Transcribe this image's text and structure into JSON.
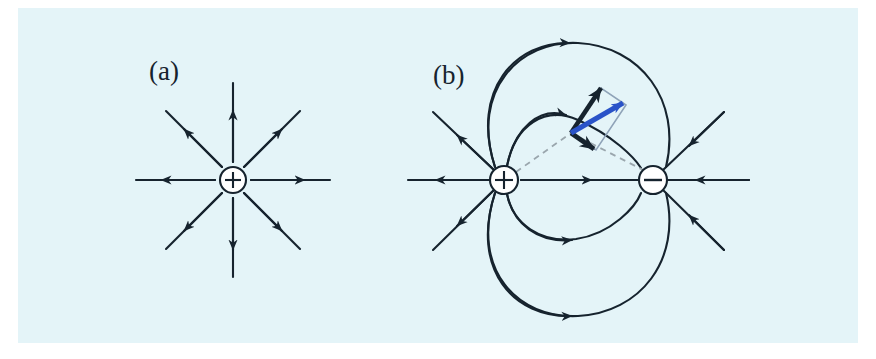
{
  "figure": {
    "background_color": "#e4f4f8",
    "page_color": "#ffffff",
    "ink_color": "#16232e",
    "accent_color": "#2a53c8",
    "dashed_color": "#9aa6ad",
    "panel_a": {
      "label": "(a)",
      "caption": "Electric field lines of an isolated positive point charge",
      "charge": {
        "sign_label": "+",
        "name": "positive-point-charge",
        "cx": 233,
        "cy": 180,
        "r": 13
      },
      "field_line_count": 8,
      "field_line_directions_deg": [
        0,
        45,
        90,
        135,
        180,
        225,
        270,
        315
      ],
      "field_line_length": 88,
      "arrow_direction": "outward"
    },
    "panel_b": {
      "label": "(b)",
      "caption": "Electric field lines of an electric dipole with vector decomposition",
      "positive_charge": {
        "sign_label": "+",
        "name": "positive-point-charge",
        "cx": 504,
        "cy": 180,
        "r": 14
      },
      "negative_charge": {
        "sign_label": "−",
        "name": "negative-point-charge",
        "cx": 653,
        "cy": 180,
        "r": 14
      },
      "field_point": {
        "x": 571,
        "y": 133
      },
      "vectors": {
        "resultant": {
          "name": "resultant-field-vector",
          "color": "#2a53c8",
          "from": {
            "x": 571,
            "y": 133
          },
          "to": {
            "x": 623,
            "y": 103
          }
        },
        "component_from_positive": {
          "name": "field-component-from-positive-charge",
          "color": "#16232e",
          "from": {
            "x": 571,
            "y": 133
          },
          "to": {
            "x": 601,
            "y": 88
          }
        },
        "component_toward_negative": {
          "name": "field-component-toward-negative-charge",
          "color": "#16232e",
          "from": {
            "x": 571,
            "y": 133
          },
          "to": {
            "x": 594,
            "y": 149
          }
        },
        "parallelogram_outline_color": "#8fa3b8"
      },
      "dashed_radius_lines": [
        {
          "name": "dashed-line-from-positive",
          "from": {
            "x": 504,
            "y": 180
          },
          "to": {
            "x": 571,
            "y": 133
          }
        },
        {
          "name": "dashed-line-to-negative",
          "from": {
            "x": 571,
            "y": 133
          },
          "to": {
            "x": 653,
            "y": 180
          }
        }
      ],
      "loop_count": 4,
      "external_line_count": 6,
      "arrow_direction": "from positive to negative"
    }
  }
}
